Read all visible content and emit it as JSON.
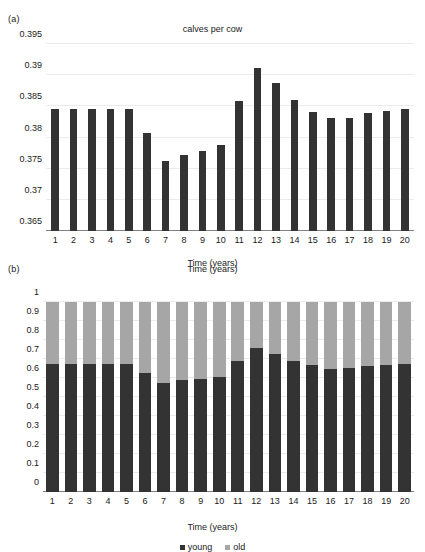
{
  "figure": {
    "panels": [
      {
        "letter": "(a)",
        "title": "calves per cow",
        "xlabel": "Time (years)"
      },
      {
        "letter": "(b)",
        "title": "Time (years)",
        "xlabel": "Time (years)"
      }
    ],
    "legend": [
      {
        "label": "young",
        "color": "#333333"
      },
      {
        "label": "old",
        "color": "#a6a6a6"
      }
    ]
  },
  "colors": {
    "young": "#333333",
    "old": "#a6a6a6",
    "axis": "#808080",
    "grid": "#eceaea",
    "text": "#1a1a1a",
    "background": "#ffffff"
  },
  "chart_data": [
    {
      "type": "bar",
      "title": "calves per cow",
      "panel": "(a)",
      "xlabel": "Time (years)",
      "ylabel": "",
      "ylim": [
        0.365,
        0.395
      ],
      "yticks": [
        0.365,
        0.37,
        0.375,
        0.38,
        0.385,
        0.39,
        0.395
      ],
      "ytick_labels": [
        "0.365",
        "0.37",
        "0.375",
        "0.38",
        "0.385",
        "0.39",
        "0.395"
      ],
      "grid": true,
      "legend": null,
      "categories": [
        1,
        2,
        3,
        4,
        5,
        6,
        7,
        8,
        9,
        10,
        11,
        12,
        13,
        14,
        15,
        16,
        17,
        18,
        19,
        20
      ],
      "xtick_labels": [
        "1",
        "2",
        "3",
        "4",
        "5",
        "6",
        "7",
        "8",
        "9",
        "10",
        "11",
        "12",
        "13",
        "14",
        "15",
        "16",
        "17",
        "18",
        "19",
        "20"
      ],
      "values": [
        0.3845,
        0.3845,
        0.3845,
        0.3845,
        0.3845,
        0.3808,
        0.3763,
        0.3772,
        0.3779,
        0.3788,
        0.3859,
        0.3912,
        0.3888,
        0.386,
        0.3841,
        0.3831,
        0.3831,
        0.3839,
        0.3842,
        0.3845
      ],
      "bar_color": "#333333"
    },
    {
      "type": "bar",
      "subtype": "stacked",
      "title": "Time (years)",
      "panel": "(b)",
      "xlabel": "Time (years)",
      "ylabel": "",
      "ylim": [
        0,
        1
      ],
      "yticks": [
        0,
        0.1,
        0.2,
        0.3,
        0.4,
        0.5,
        0.6,
        0.7,
        0.8,
        0.9,
        1
      ],
      "ytick_labels": [
        "0",
        "0.1",
        "0.2",
        "0.3",
        "0.4",
        "0.5",
        "0.6",
        "0.7",
        "0.8",
        "0.9",
        "1"
      ],
      "grid": true,
      "legend_position": "bottom",
      "categories": [
        1,
        2,
        3,
        4,
        5,
        6,
        7,
        8,
        9,
        10,
        11,
        12,
        13,
        14,
        15,
        16,
        17,
        18,
        19,
        20
      ],
      "xtick_labels": [
        "1",
        "2",
        "3",
        "4",
        "5",
        "6",
        "7",
        "8",
        "9",
        "10",
        "11",
        "12",
        "13",
        "14",
        "15",
        "16",
        "17",
        "18",
        "19",
        "20"
      ],
      "series": [
        {
          "name": "young",
          "color": "#333333",
          "values": [
            0.675,
            0.675,
            0.675,
            0.673,
            0.672,
            0.628,
            0.575,
            0.589,
            0.597,
            0.607,
            0.691,
            0.76,
            0.729,
            0.691,
            0.666,
            0.65,
            0.652,
            0.661,
            0.669,
            0.673
          ]
        },
        {
          "name": "old",
          "color": "#a6a6a6",
          "values": [
            0.325,
            0.325,
            0.325,
            0.327,
            0.328,
            0.372,
            0.425,
            0.411,
            0.403,
            0.393,
            0.309,
            0.24,
            0.271,
            0.309,
            0.334,
            0.35,
            0.348,
            0.339,
            0.331,
            0.327
          ]
        }
      ]
    }
  ]
}
